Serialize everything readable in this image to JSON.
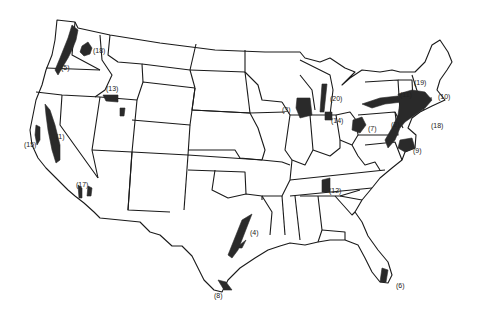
{
  "map": {
    "subject": "Contiguous United States",
    "style": "black-and-white outline map with shaded numbered regions",
    "colors": {
      "background": "#ffffff",
      "outline": "#1a1a1a",
      "shaded_region": "#2a2a2a",
      "label": "#222222"
    },
    "regions": [
      {
        "id": "1",
        "label": "(1)",
        "location": "California Central Valley",
        "x": 64,
        "y": 137
      },
      {
        "id": "2",
        "label": "(2)",
        "location": "Philadelphia – New Jersey corridor",
        "x": 398,
        "y": 119
      },
      {
        "id": "3",
        "label": "(3)",
        "location": "Southeastern Wisconsin / Chicago",
        "x": 289,
        "y": 106
      },
      {
        "id": "4",
        "label": "(4)",
        "location": "Dallas – Houston, Texas",
        "x": 251,
        "y": 227
      },
      {
        "id": "5",
        "label": "(5)",
        "location": "Willamette Valley, Oregon",
        "x": 63,
        "y": 64
      },
      {
        "id": "6",
        "label": "(6)",
        "location": "Southeast Florida",
        "x": 396,
        "y": 282
      },
      {
        "id": "7",
        "label": "(7)",
        "location": "Western Pennsylvania / Pittsburgh",
        "x": 368,
        "y": 125
      },
      {
        "id": "8",
        "label": "(8)",
        "location": "Lower Rio Grande Valley, Texas",
        "x": 217,
        "y": 290
      },
      {
        "id": "9",
        "label": "(9)",
        "location": "Baltimore – Washington",
        "x": 414,
        "y": 146
      },
      {
        "id": "10",
        "label": "(10)",
        "location": "Boston, Massachusetts",
        "x": 439,
        "y": 94
      },
      {
        "id": "11",
        "label": "(11)",
        "location": "Upstate New York",
        "x": 401,
        "y": 92
      },
      {
        "id": "12",
        "label": "(12)",
        "location": "Central Tennessee / Nashville",
        "x": 330,
        "y": 189
      },
      {
        "id": "13",
        "label": "(13)",
        "location": "Snake River Plain, Idaho",
        "x": 108,
        "y": 86
      },
      {
        "id": "14",
        "label": "(14)",
        "location": "Southeastern Michigan / Detroit",
        "x": 333,
        "y": 117
      },
      {
        "id": "15",
        "label": "(15)",
        "location": "San Francisco Bay Area",
        "x": 26,
        "y": 143
      },
      {
        "id": "17",
        "label": "(17)",
        "location": "Los Angeles – San Diego",
        "x": 78,
        "y": 183
      },
      {
        "id": "18",
        "label": "(18)",
        "location": "Puget Sound / Spokane, Washington",
        "x": 94,
        "y": 48
      },
      {
        "id": "18b",
        "label": "(18)",
        "location": "New York City – Long Island",
        "x": 433,
        "y": 122
      },
      {
        "id": "19",
        "label": "(19)",
        "location": "Vermont / New Hampshire",
        "x": 415,
        "y": 80
      },
      {
        "id": "20",
        "label": "(20)",
        "location": "Western Michigan",
        "x": 330,
        "y": 95
      }
    ]
  }
}
